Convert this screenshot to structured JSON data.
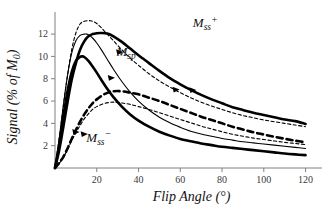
{
  "chart_data": {
    "type": "line",
    "title": "",
    "xlabel": "Flip Angle (°)",
    "ylabel": "Signal (% of M0)",
    "ylabel_parts": {
      "main": "Signal (% of M",
      "sub": "0",
      "tail": ")"
    },
    "xlim": [
      0,
      125
    ],
    "ylim": [
      0,
      13.8
    ],
    "xticks": [
      20,
      40,
      60,
      80,
      100,
      120
    ],
    "yticks": [
      2,
      4,
      6,
      8,
      10,
      12
    ],
    "grid": false,
    "legend": "inline-annotations",
    "annotations": [
      {
        "id": "mss-plus",
        "text": "M",
        "sub": "ss",
        "sup": "+",
        "x": 72,
        "y": 12.6
      },
      {
        "id": "msp",
        "text": "M",
        "sub": "sp",
        "sup": "",
        "x": 34,
        "y": 10.05
      },
      {
        "id": "mss-minus",
        "text": "M",
        "sub": "ss",
        "sup": "−",
        "x": 21,
        "y": 2.35
      }
    ],
    "series": [
      {
        "name": "Mss+ thin dashed",
        "style": "dashed",
        "width": "thin",
        "color": "#000000",
        "peak": {
          "x": 17,
          "y": 13.2
        },
        "x": [
          0,
          2,
          4,
          6,
          8,
          10,
          12,
          14,
          16,
          17,
          18,
          20,
          22,
          25,
          28,
          32,
          36,
          40,
          45,
          50,
          55,
          60,
          65,
          70,
          75,
          80,
          85,
          90,
          95,
          100,
          105,
          110,
          115,
          120
        ],
        "y": [
          0,
          2.6,
          5.6,
          8.3,
          10.6,
          12.1,
          12.9,
          13.15,
          13.2,
          13.2,
          13.15,
          12.95,
          12.6,
          12.0,
          11.4,
          10.6,
          9.85,
          9.2,
          8.45,
          7.8,
          7.25,
          6.75,
          6.3,
          5.9,
          5.55,
          5.25,
          4.95,
          4.7,
          4.5,
          4.3,
          4.15,
          4.0,
          3.85,
          3.7
        ]
      },
      {
        "name": "Mss+ thick solid",
        "style": "solid",
        "width": "thick",
        "color": "#000000",
        "peak": {
          "x": 25,
          "y": 12.1
        },
        "x": [
          0,
          2,
          4,
          6,
          8,
          10,
          12,
          14,
          16,
          18,
          20,
          22,
          25,
          28,
          32,
          36,
          40,
          45,
          50,
          55,
          60,
          65,
          70,
          75,
          80,
          85,
          90,
          95,
          100,
          105,
          110,
          115,
          120
        ],
        "y": [
          0,
          1.6,
          3.7,
          5.9,
          7.9,
          9.4,
          10.6,
          11.35,
          11.8,
          12.0,
          12.08,
          12.1,
          12.05,
          11.8,
          11.3,
          10.7,
          10.1,
          9.4,
          8.7,
          8.05,
          7.5,
          7.0,
          6.55,
          6.15,
          5.8,
          5.45,
          5.2,
          4.95,
          4.75,
          4.55,
          4.35,
          4.2,
          3.95
        ]
      },
      {
        "name": "Msp thin solid",
        "style": "solid",
        "width": "thin",
        "color": "#000000",
        "peak": {
          "x": 15,
          "y": 12.0
        },
        "x": [
          0,
          2,
          4,
          6,
          8,
          10,
          12,
          14,
          15,
          16,
          18,
          20,
          22,
          25,
          28,
          32,
          36,
          40,
          45,
          50,
          55,
          60,
          65,
          70,
          75,
          80,
          85,
          90,
          95,
          100,
          105,
          110,
          115,
          120
        ],
        "y": [
          0,
          2.6,
          5.6,
          8.3,
          10.3,
          11.4,
          11.88,
          12.0,
          12.0,
          11.95,
          11.65,
          11.2,
          10.65,
          9.75,
          8.85,
          7.75,
          6.8,
          6.0,
          5.2,
          4.55,
          4.05,
          3.65,
          3.3,
          3.05,
          2.85,
          2.65,
          2.5,
          2.35,
          2.25,
          2.15,
          2.05,
          1.95,
          1.85,
          1.75
        ]
      },
      {
        "name": "Msp thick solid lower",
        "style": "solid",
        "width": "thick",
        "color": "#000000",
        "peak": {
          "x": 13,
          "y": 10.0
        },
        "x": [
          0,
          2,
          4,
          6,
          8,
          10,
          12,
          13,
          14,
          16,
          18,
          20,
          22,
          25,
          28,
          32,
          36,
          40,
          45,
          50,
          55,
          60,
          65,
          70,
          75,
          80,
          85,
          90,
          95,
          100,
          105,
          110,
          115,
          120
        ],
        "y": [
          0,
          2.1,
          4.6,
          6.9,
          8.6,
          9.6,
          9.95,
          10.0,
          9.95,
          9.6,
          9.1,
          8.55,
          7.95,
          7.1,
          6.35,
          5.5,
          4.8,
          4.25,
          3.7,
          3.25,
          2.9,
          2.6,
          2.4,
          2.2,
          2.05,
          1.9,
          1.8,
          1.7,
          1.6,
          1.5,
          1.4,
          1.3,
          1.22,
          1.15
        ]
      },
      {
        "name": "Mss- thick dashed",
        "style": "dashed",
        "width": "thick",
        "color": "#000000",
        "peak": {
          "x": 30,
          "y": 6.9
        },
        "x": [
          0,
          2,
          4,
          6,
          8,
          10,
          12,
          14,
          16,
          18,
          20,
          23,
          26,
          28,
          30,
          33,
          36,
          40,
          45,
          50,
          55,
          60,
          65,
          70,
          75,
          80,
          85,
          90,
          95,
          100,
          105,
          110,
          115,
          120
        ],
        "y": [
          0,
          0.45,
          1.0,
          1.75,
          2.6,
          3.4,
          4.15,
          4.8,
          5.35,
          5.8,
          6.15,
          6.55,
          6.8,
          6.87,
          6.9,
          6.85,
          6.75,
          6.6,
          6.3,
          6.0,
          5.65,
          5.3,
          4.95,
          4.6,
          4.3,
          4.0,
          3.7,
          3.45,
          3.2,
          3.0,
          2.8,
          2.62,
          2.45,
          2.3
        ]
      },
      {
        "name": "Mss- thin dashed",
        "style": "dashed",
        "width": "thin",
        "color": "#000000",
        "peak": {
          "x": 28,
          "y": 5.9
        },
        "x": [
          0,
          2,
          4,
          6,
          8,
          10,
          12,
          14,
          16,
          18,
          20,
          23,
          26,
          28,
          30,
          33,
          36,
          40,
          45,
          50,
          55,
          60,
          65,
          70,
          75,
          80,
          85,
          90,
          95,
          100,
          105,
          110,
          115,
          120
        ],
        "y": [
          0,
          0.4,
          0.95,
          1.65,
          2.45,
          3.15,
          3.8,
          4.4,
          4.85,
          5.25,
          5.5,
          5.75,
          5.87,
          5.9,
          5.88,
          5.8,
          5.7,
          5.5,
          5.25,
          4.95,
          4.65,
          4.35,
          4.05,
          3.75,
          3.5,
          3.25,
          3.02,
          2.85,
          2.68,
          2.55,
          2.42,
          2.3,
          2.2,
          2.1
        ]
      }
    ],
    "markers": [
      {
        "series": "Mss+ thin dashed",
        "x": 58,
        "y": 7.0
      },
      {
        "series": "Mss+ thick solid",
        "x": 66,
        "y": 6.95
      },
      {
        "series": "Msp thin solid",
        "x": 31,
        "y": 10.35
      },
      {
        "series": "Msp thick solid lower",
        "x": 27,
        "y": 8.05
      },
      {
        "series": "Mss- thick dashed",
        "x": 10,
        "y": 3.2
      },
      {
        "series": "Mss- thin dashed",
        "x": 14,
        "y": 3.0
      }
    ]
  }
}
